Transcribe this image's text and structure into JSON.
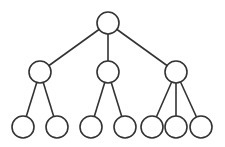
{
  "diagram": {
    "type": "tree",
    "style": {
      "stroke": "#333333",
      "fill": "#ffffff",
      "background": "#ffffff",
      "radius": 11
    },
    "nodes": [
      {
        "id": "root",
        "x": 108,
        "y": 23,
        "level": 0
      },
      {
        "id": "a",
        "x": 40,
        "y": 72,
        "level": 1
      },
      {
        "id": "b",
        "x": 108,
        "y": 72,
        "level": 1
      },
      {
        "id": "c",
        "x": 176,
        "y": 72,
        "level": 1
      },
      {
        "id": "a1",
        "x": 23,
        "y": 127,
        "level": 2
      },
      {
        "id": "a2",
        "x": 57,
        "y": 127,
        "level": 2
      },
      {
        "id": "b1",
        "x": 91,
        "y": 127,
        "level": 2
      },
      {
        "id": "b2",
        "x": 125,
        "y": 127,
        "level": 2
      },
      {
        "id": "c1",
        "x": 152,
        "y": 127,
        "level": 2
      },
      {
        "id": "c2",
        "x": 176,
        "y": 127,
        "level": 2
      },
      {
        "id": "c3",
        "x": 201,
        "y": 127,
        "level": 2
      }
    ],
    "edges": [
      [
        "root",
        "a"
      ],
      [
        "root",
        "b"
      ],
      [
        "root",
        "c"
      ],
      [
        "a",
        "a1"
      ],
      [
        "a",
        "a2"
      ],
      [
        "b",
        "b1"
      ],
      [
        "b",
        "b2"
      ],
      [
        "c",
        "c1"
      ],
      [
        "c",
        "c2"
      ],
      [
        "c",
        "c3"
      ]
    ]
  }
}
